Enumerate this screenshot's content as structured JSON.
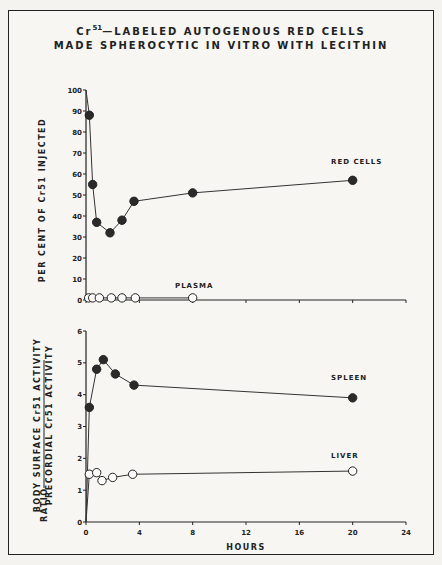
{
  "title": {
    "line1_prefix": "Cr",
    "line1_sup": "51",
    "line1_rest": "—LABELED AUTOGENOUS RED CELLS",
    "line2": "MADE SPHEROCYTIC IN VITRO WITH LECITHIN"
  },
  "chart_data": [
    {
      "type": "line",
      "title": "Cr51-LABELED AUTOGENOUS RED CELLS MADE SPHEROCYTIC IN VITRO WITH LECITHIN",
      "xlabel": "HOURS",
      "ylabel": "PER CENT OF Cr51 INJECTED",
      "xlim": [
        0,
        24
      ],
      "ylim": [
        0,
        100
      ],
      "xticks": [
        0,
        4,
        8,
        12,
        16,
        20,
        24
      ],
      "yticks": [
        0,
        10,
        20,
        30,
        40,
        50,
        60,
        70,
        80,
        90,
        100
      ],
      "grid": false,
      "series": [
        {
          "name": "RED CELLS",
          "marker": "filled-circle",
          "x": [
            0,
            0.25,
            0.5,
            0.8,
            1.8,
            2.7,
            3.6,
            8,
            20
          ],
          "y": [
            100,
            88,
            55,
            37,
            32,
            38,
            47,
            51,
            57
          ]
        },
        {
          "name": "PLASMA",
          "marker": "open-circle",
          "x": [
            0.2,
            0.5,
            1.0,
            1.9,
            2.7,
            3.7,
            8
          ],
          "y": [
            1,
            1,
            1,
            1,
            1,
            1,
            1
          ]
        }
      ]
    },
    {
      "type": "line",
      "xlabel": "HOURS",
      "ylabel": "RATIO BODY SURFACE Cr51 ACTIVITY / PRECORDIAL Cr51 ACTIVITY",
      "xlim": [
        0,
        24
      ],
      "ylim": [
        0,
        6
      ],
      "xticks": [
        0,
        4,
        8,
        12,
        16,
        20,
        24
      ],
      "yticks": [
        0,
        1,
        2,
        3,
        4,
        5,
        6
      ],
      "grid": false,
      "series": [
        {
          "name": "SPLEEN",
          "marker": "filled-circle",
          "x": [
            0,
            0.25,
            0.8,
            1.3,
            2.2,
            3.6,
            20
          ],
          "y": [
            0,
            3.6,
            4.8,
            5.1,
            4.65,
            4.3,
            3.9
          ]
        },
        {
          "name": "LIVER",
          "marker": "open-circle",
          "x": [
            0,
            0.25,
            0.8,
            1.2,
            2.0,
            3.5,
            20
          ],
          "y": [
            0,
            1.5,
            1.55,
            1.3,
            1.4,
            1.5,
            1.6
          ]
        }
      ]
    }
  ],
  "labels": {
    "upper_ylabel": "PER CENT OF Cr51 INJECTED",
    "lower_ylabel_numerator": "BODY SURFACE Cr51 ACTIVITY",
    "lower_ylabel_denominator": "PRECORDIAL Cr51 ACTIVITY",
    "lower_ylabel_prefix": "RATIO",
    "xlabel": "HOURS",
    "red_cells": "RED CELLS",
    "plasma": "PLASMA",
    "spleen": "SPLEEN",
    "liver": "LIVER"
  }
}
